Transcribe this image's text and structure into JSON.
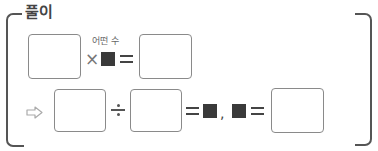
{
  "section": {
    "title": "풀이"
  },
  "row1": {
    "annotation": "어떤 수",
    "operator_multiply": "×",
    "unknown_symbol": "■",
    "operator_equals": "=",
    "boxes": [
      "",
      ""
    ]
  },
  "row2": {
    "arrow_symbol": "⇨",
    "operator_divide": "÷",
    "operator_equals": "=",
    "unknown_symbol": "■",
    "separator": ",",
    "boxes": [
      "",
      "",
      ""
    ]
  },
  "colors": {
    "bracket": "#555555",
    "box_border": "#8a8a8a",
    "unknown_fill": "#3a3a3a"
  }
}
